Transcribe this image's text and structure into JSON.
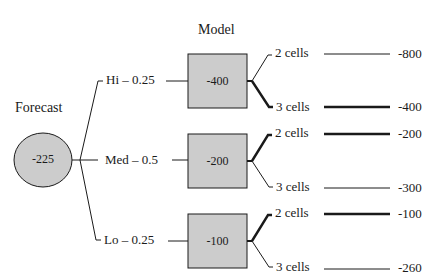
{
  "diagram": {
    "type": "decision-tree",
    "headers": {
      "forecast": "Forecast",
      "model": "Model"
    },
    "root": {
      "shape": "circle",
      "value": "-225",
      "fill": "#cccccc"
    },
    "branches": [
      {
        "label": "Hi – 0.25",
        "model_value": "-400",
        "outcomes": [
          {
            "label": "2 cells",
            "value": "-800",
            "bold": false
          },
          {
            "label": "3 cells",
            "value": "-400",
            "bold": true
          }
        ]
      },
      {
        "label": "Med – 0.5",
        "model_value": "-200",
        "outcomes": [
          {
            "label": "2 cells",
            "value": "-200",
            "bold": true
          },
          {
            "label": "3 cells",
            "value": "-300",
            "bold": false
          }
        ]
      },
      {
        "label": "Lo – 0.25",
        "model_value": "-100",
        "outcomes": [
          {
            "label": "2 cells",
            "value": "-100",
            "bold": true
          },
          {
            "label": "3 cells",
            "value": "-260",
            "bold": false
          }
        ]
      }
    ],
    "colors": {
      "node_fill": "#cccccc",
      "stroke": "#1a1a1a",
      "background": "#ffffff"
    }
  }
}
